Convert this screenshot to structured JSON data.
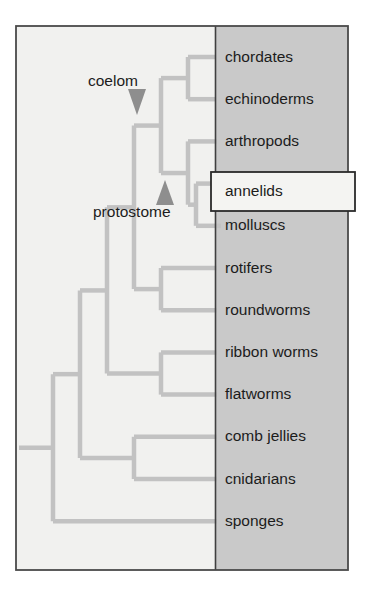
{
  "figure": {
    "type": "cladogram",
    "title": "",
    "highlighted_taxon": "annelids",
    "colors": {
      "outer_border": "#4a4a4a",
      "left_background": "#f1f1ef",
      "label_panel_background": "#c9c9c9",
      "panel_divider": "#3f3f3f",
      "branch": "#c2c2c2",
      "arrow": "#8e8e8e",
      "callout_fill": "#f4f4f2",
      "callout_border": "#2b2b2b",
      "text": "#1c1c1c"
    },
    "geometry": {
      "outer_x": 16,
      "outer_y": 26,
      "outer_w": 332,
      "outer_h": 544,
      "panel_x": 215,
      "label_text_x": 225,
      "first_tip_y": 57,
      "tip_spacing": 42.2,
      "branch_width": 4.5
    }
  },
  "taxa": [
    {
      "name": "chordates",
      "tip_x": 196
    },
    {
      "name": "echinoderms",
      "tip_x": 196
    },
    {
      "name": "arthropods",
      "tip_x": 205
    },
    {
      "name": "annelids",
      "tip_x": 211
    },
    {
      "name": "molluscs",
      "tip_x": 209
    },
    {
      "name": "rotifers",
      "tip_x": 205
    },
    {
      "name": "roundworms",
      "tip_x": 205
    },
    {
      "name": "ribbon worms",
      "tip_x": 205
    },
    {
      "name": "flatworms",
      "tip_x": 205
    },
    {
      "name": "comb jellies",
      "tip_x": 205
    },
    {
      "name": "cnidarians",
      "tip_x": 205
    },
    {
      "name": "sponges",
      "tip_x": 205
    }
  ],
  "node_annotations": [
    {
      "label": "coelom",
      "label_x": 88,
      "label_y": 82,
      "arrow_direction": "down",
      "arrow_x": 137,
      "arrow_top_y": 89,
      "arrow_bottom_y": 115,
      "arrow_half_width": 9
    },
    {
      "label": "protostome",
      "label_x": 93,
      "label_y": 213,
      "arrow_direction": "up",
      "arrow_x": 165,
      "arrow_top_y": 180,
      "arrow_bottom_y": 205,
      "arrow_half_width": 9
    }
  ],
  "callout": {
    "label": "annelids",
    "x": 211,
    "y": 172,
    "width": 144,
    "height": 39,
    "text_x": 225,
    "text_y": 192
  },
  "branches": {
    "comment": "Rectilinear cladogram segments in SVG pixel coordinates.",
    "root_x": 19,
    "root_y": 292,
    "vertical_spines": [
      {
        "x": 19,
        "y1": 292,
        "y2": 292
      },
      {
        "x": 53,
        "y1": 246,
        "y2": 541
      },
      {
        "x": 80,
        "y1": 205,
        "y2": 478
      },
      {
        "x": 107,
        "y1": 163,
        "y2": 436
      },
      {
        "x": 134,
        "y1": 120,
        "y2": 247
      },
      {
        "x": 161,
        "y1": 78,
        "y2": 205
      },
      {
        "x": 188,
        "y1": 57,
        "y2": 99
      },
      {
        "x": 188,
        "y1": 141,
        "y2": 184
      },
      {
        "x": 196,
        "y1": 184,
        "y2": 226
      },
      {
        "x": 161,
        "y1": 268,
        "y2": 310
      },
      {
        "x": 134,
        "y1": 289,
        "y2": 352
      },
      {
        "x": 161,
        "y1": 352,
        "y2": 394
      },
      {
        "x": 107,
        "y1": 436,
        "y2": 478
      },
      {
        "x": 134,
        "y1": 415,
        "y2": 478
      }
    ]
  },
  "chart_data": {
    "type": "tree",
    "leaves": [
      "chordates",
      "echinoderms",
      "arthropods",
      "annelids",
      "molluscs",
      "rotifers",
      "roundworms",
      "ribbon worms",
      "flatworms",
      "comb jellies",
      "cnidarians",
      "sponges"
    ],
    "internal_node_labels": [
      "coelom",
      "protostome"
    ],
    "highlighted_leaf": "annelids",
    "topology": "(((((((((((chordates,echinoderms),(arthropods,(annelids,molluscs))),(rotifers,roundworms)),(ribbon worms,flatworms)),(comb jellies,cnidarians)),sponges)"
  }
}
